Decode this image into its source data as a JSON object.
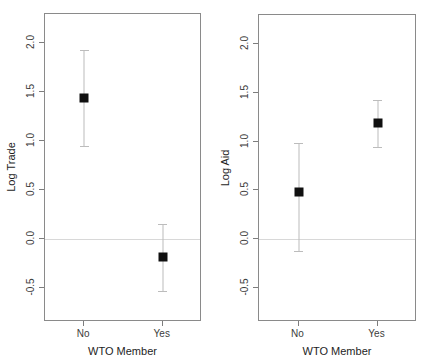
{
  "figure": {
    "width": 431,
    "height": 364,
    "background": "#ffffff",
    "marker_color": "#101010",
    "errorbar_color": "#bcbcbc",
    "zero_line_color": "#d8d8d8",
    "frame_color": "#8a8a8a"
  },
  "chart_data": [
    {
      "type": "scatter",
      "panel": "left",
      "title": "",
      "xlabel": "WTO Member",
      "ylabel": "Log Trade",
      "categories": [
        "No",
        "Yes"
      ],
      "values": [
        1.44,
        -0.19
      ],
      "error_low": [
        0.94,
        -0.54
      ],
      "error_high": [
        1.93,
        0.15
      ],
      "ylim": [
        -0.85,
        2.3
      ],
      "yticks": [
        -0.5,
        0.0,
        0.5,
        1.0,
        1.5,
        2.0
      ],
      "ytick_labels": [
        "-0.5",
        "0.0",
        "0.5",
        "1.0",
        "1.5",
        "2.0"
      ],
      "grid": false,
      "legend": "none",
      "reference_line_y": 0.0,
      "annotations": []
    },
    {
      "type": "scatter",
      "panel": "right",
      "title": "",
      "xlabel": "WTO Member",
      "ylabel": "Log Aid",
      "categories": [
        "No",
        "Yes"
      ],
      "values": [
        0.48,
        1.19
      ],
      "error_low": [
        -0.13,
        0.94
      ],
      "error_high": [
        0.99,
        1.43
      ],
      "ylim": [
        -0.85,
        2.3
      ],
      "yticks": [
        -0.5,
        0.0,
        0.5,
        1.0,
        1.5,
        2.0
      ],
      "ytick_labels": [
        "-0.5",
        "0.0",
        "0.5",
        "1.0",
        "1.5",
        "2.0"
      ],
      "grid": false,
      "legend": "none",
      "reference_line_y": 0.0,
      "annotations": []
    }
  ]
}
